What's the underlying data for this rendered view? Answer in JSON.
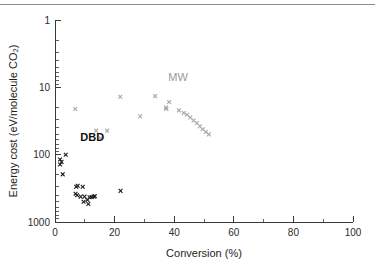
{
  "figure": {
    "background": "#ffffff",
    "top_rule_color": "#8a8a8a"
  },
  "axes": {
    "x": {
      "label": "Conversion (%)",
      "min": 0,
      "max": 100,
      "scale": "linear",
      "ticks": [
        "0",
        "20",
        "40",
        "60",
        "80",
        "100"
      ],
      "tick_values": [
        0,
        20,
        40,
        60,
        80,
        100
      ],
      "minor_tick_values": [
        10,
        30,
        50,
        70,
        90
      ]
    },
    "y": {
      "label": "Energy cost (eV/molecule CO₂)",
      "min": 1,
      "max": 1000,
      "scale": "log",
      "inverted": true,
      "ticks": [
        "1",
        "10",
        "100",
        "1000"
      ],
      "tick_values": [
        1,
        10,
        100,
        1000
      ]
    }
  },
  "annotations": [
    {
      "text": "DBD",
      "x": 8.5,
      "y": 62,
      "color": "#111111",
      "bold": true
    },
    {
      "text": "MW",
      "x": 38.0,
      "y": 8.0,
      "color": "#9a9a9a",
      "bold": false
    }
  ],
  "chart_data": {
    "type": "scatter",
    "title": "",
    "xlabel": "Conversion (%)",
    "ylabel": "Energy cost (eV/molecule CO₂)",
    "xlim": [
      0,
      100
    ],
    "ylim": [
      1,
      1000
    ],
    "yscale": "log",
    "y_inverted": true,
    "grid": false,
    "legend": "none",
    "series": [
      {
        "name": "DBD",
        "color": "#1a1a1a",
        "marker": "x",
        "points": [
          {
            "x": 1.7,
            "y": 118
          },
          {
            "x": 1.7,
            "y": 140
          },
          {
            "x": 2.2,
            "y": 128
          },
          {
            "x": 3.6,
            "y": 100
          },
          {
            "x": 2.6,
            "y": 196
          },
          {
            "x": 7.1,
            "y": 300
          },
          {
            "x": 7.6,
            "y": 290
          },
          {
            "x": 6.9,
            "y": 380
          },
          {
            "x": 7.4,
            "y": 400
          },
          {
            "x": 9.3,
            "y": 300
          },
          {
            "x": 8.6,
            "y": 420
          },
          {
            "x": 9.9,
            "y": 420
          },
          {
            "x": 9.6,
            "y": 500
          },
          {
            "x": 10.9,
            "y": 470
          },
          {
            "x": 11.6,
            "y": 430
          },
          {
            "x": 12.3,
            "y": 425
          },
          {
            "x": 13.0,
            "y": 420
          },
          {
            "x": 13.4,
            "y": 415
          },
          {
            "x": 11.2,
            "y": 540
          },
          {
            "x": 22.0,
            "y": 345
          }
        ]
      },
      {
        "name": "MW",
        "color": "#a8a8a8",
        "marker": "x",
        "points": [
          {
            "x": 33.6,
            "y": 13.5
          },
          {
            "x": 37.2,
            "y": 20.0
          },
          {
            "x": 38.3,
            "y": 16.5
          },
          {
            "x": 37.4,
            "y": 21.0
          },
          {
            "x": 41.6,
            "y": 22.0
          },
          {
            "x": 43.2,
            "y": 24.0
          },
          {
            "x": 44.3,
            "y": 25.5
          },
          {
            "x": 45.4,
            "y": 28.0
          },
          {
            "x": 46.5,
            "y": 31.0
          },
          {
            "x": 47.6,
            "y": 34.0
          },
          {
            "x": 48.6,
            "y": 38.0
          },
          {
            "x": 49.6,
            "y": 42.0
          },
          {
            "x": 50.6,
            "y": 46.0
          },
          {
            "x": 51.6,
            "y": 50.0
          }
        ]
      },
      {
        "name": "intermediate",
        "color": "#a8a8a8",
        "marker": "x",
        "points": [
          {
            "x": 6.8,
            "y": 21.0
          },
          {
            "x": 13.8,
            "y": 44.0
          },
          {
            "x": 15.3,
            "y": 57.0
          },
          {
            "x": 17.5,
            "y": 44.0
          },
          {
            "x": 21.9,
            "y": 13.8
          },
          {
            "x": 28.6,
            "y": 27.0
          }
        ]
      }
    ]
  }
}
